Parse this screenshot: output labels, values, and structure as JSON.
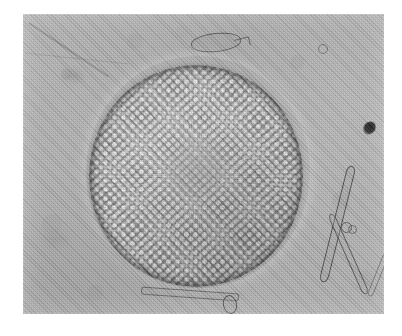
{
  "page": {
    "background_color": "#ffffff",
    "width": 402,
    "height": 336
  },
  "plate": {
    "name": "photomicrograph",
    "modality": "light microscopy, brightfield",
    "rendering": "grayscale halftone scan",
    "background_color": "#b5b5b5",
    "x": 23,
    "y": 14,
    "width": 361,
    "height": 300
  },
  "specimen": {
    "label": "centric diatom valve",
    "shape": "circular",
    "center_x": 196,
    "center_y": 172,
    "diameter_px": 214,
    "fill_color": "#8e8e8e",
    "rim_color": "#464646",
    "areola_color": "#f2f2f2",
    "features": [
      "areolae in radial striae",
      "central annulus",
      "marginal rim"
    ]
  },
  "field_debris": [
    {
      "label": "needle diatom upper limb",
      "x": 333,
      "y": 164
    },
    {
      "label": "needle diatom crossing limb",
      "x": 345,
      "y": 210
    },
    {
      "label": "needle diatom stub",
      "x": 375,
      "y": 252
    },
    {
      "label": "elongate fragment above valve",
      "x": 191,
      "y": 33
    },
    {
      "label": "linear fragment along bottom",
      "x": 166,
      "y": 290
    },
    {
      "label": "ring structure bottom centre",
      "x": 206,
      "y": 295
    },
    {
      "label": "paired ring right of valve",
      "x": 342,
      "y": 222
    },
    {
      "label": "small ring upper right",
      "x": 318,
      "y": 44
    },
    {
      "label": "dark opaque speck",
      "x": 366,
      "y": 128
    },
    {
      "label": "diagonal scratch upper left",
      "x": 60,
      "y": 40
    }
  ]
}
